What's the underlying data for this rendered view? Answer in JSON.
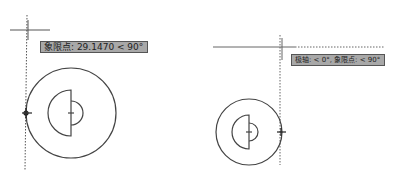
{
  "panels": [
    {
      "name": "left",
      "tooltip": "象限点: 29.1470 < 90°",
      "crosshair": {
        "x": 28,
        "y": 30
      },
      "circle": {
        "cx": 71,
        "cy": 113,
        "r": 45
      },
      "inner": {
        "cx": 71,
        "cy": 113,
        "r_big": 23,
        "r_small": 12
      }
    },
    {
      "name": "right",
      "tooltip": "极轴: < 0°,  象限点: < 90°",
      "crosshair": {
        "x": 280,
        "y": 47
      },
      "circle": {
        "cx": 249,
        "cy": 132,
        "r": 33
      },
      "inner": {
        "cx": 249,
        "cy": 132,
        "r_big": 17,
        "r_small": 9
      }
    }
  ],
  "colors": {
    "line": "#444444",
    "tooltip_bg": "#a8a8a8",
    "tooltip_border": "#555555"
  }
}
